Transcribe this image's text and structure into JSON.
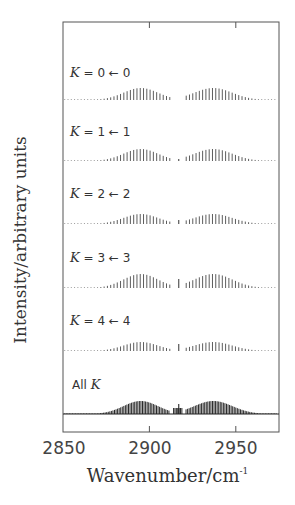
{
  "chart_data": {
    "type": "stick-spectrum (stacked panels)",
    "note": "No numeric intensity scale is shown (y-axis is arbitrary units). Only axis text, x-tick labels, x-range, and panel labels are read directly. Branch centers and the central gap are approximate pixel readings; no per-line intensities are recorded.",
    "xlabel": "Wavenumber/cm",
    "xlabel_superscript": "-1",
    "ylabel": "Intensity/arbitrary units",
    "x_ticks": [
      2850,
      2900,
      2950
    ],
    "xlim_approx": [
      2850,
      2975
    ],
    "y_ticks": [],
    "grid": false,
    "panels": [
      {
        "label_prefix": "K",
        "label_rest": " = 0 ← 0",
        "shape": "two branches (P and R) with a gap near ~2917; very weak/no central Q spike",
        "approx_branch_centers": [
          2895,
          2937
        ]
      },
      {
        "label_prefix": "K",
        "label_rest": " = 1 ← 1",
        "shape": "two branches with a small central Q feature",
        "approx_branch_centers": [
          2895,
          2937
        ]
      },
      {
        "label_prefix": "K",
        "label_rest": " = 2 ← 2",
        "shape": "two branches with a small central Q line",
        "approx_branch_centers": [
          2895,
          2937
        ]
      },
      {
        "label_prefix": "K",
        "label_rest": " = 3 ← 3",
        "shape": "two stronger branches with a distinct central Q line",
        "approx_branch_centers": [
          2895,
          2937
        ]
      },
      {
        "label_prefix": "K",
        "label_rest": " = 4 ← 4",
        "shape": "two weaker branches with a central Q line",
        "approx_branch_centers": [
          2895,
          2937
        ]
      },
      {
        "label_prefix": "All ",
        "label_k": "K",
        "shape": "sum of all K components; dense overlapping lines, cluster of Q lines near ~2917",
        "approx_branch_centers": [
          2895,
          2937
        ]
      }
    ]
  }
}
